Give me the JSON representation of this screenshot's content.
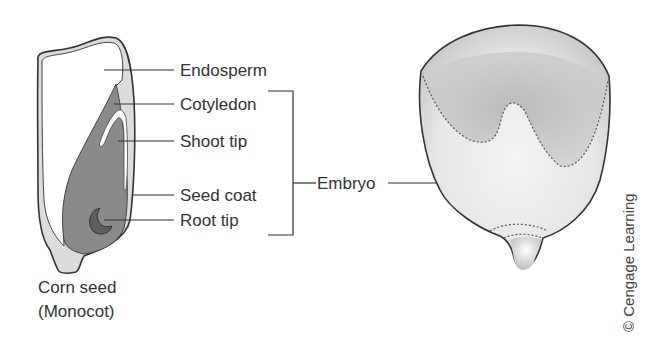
{
  "diagram": {
    "labels": {
      "endosperm": "Endosperm",
      "cotyledon": "Cotyledon",
      "shoot_tip": "Shoot tip",
      "seed_coat": "Seed coat",
      "root_tip": "Root tip",
      "embryo": "Embryo"
    },
    "caption": {
      "line1": "Corn seed",
      "line2": "(Monocot)"
    },
    "copyright": "© Cengage Learning",
    "colors": {
      "embryo_fill": "#8a8a8a",
      "root_fill": "#5e5e5e",
      "seed_coat_fill": "#dcdcdc",
      "outline": "#333333"
    }
  }
}
